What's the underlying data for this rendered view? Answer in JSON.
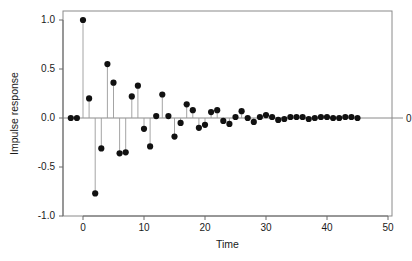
{
  "chart_data": {
    "type": "scatter",
    "title": "",
    "subtitle": "",
    "xlabel": "Time",
    "ylabel": "Impulse response",
    "xlim": [
      -4,
      51
    ],
    "ylim": [
      -1.12,
      1.12
    ],
    "grid": false,
    "legend": null,
    "style": "stem-plot with points and vertical stems to zero baseline",
    "xticks": [
      "0",
      "10",
      "20",
      "30",
      "40",
      "50"
    ],
    "xtick_values": [
      0,
      10,
      20,
      30,
      40,
      50
    ],
    "yticks": [
      "1.0",
      "0.5",
      "0.0",
      "-0.5",
      "-1.0"
    ],
    "ytick_values": [
      1.0,
      0.5,
      0.0,
      -0.5,
      -1.0
    ],
    "right_axis_label": "0",
    "right_axis_value": 0,
    "x": [
      -2,
      -1,
      0,
      1,
      2,
      3,
      4,
      5,
      6,
      7,
      8,
      9,
      10,
      11,
      12,
      13,
      14,
      15,
      16,
      17,
      18,
      19,
      20,
      21,
      22,
      23,
      24,
      25,
      26,
      27,
      28,
      29,
      30,
      31,
      32,
      33,
      34,
      35,
      36,
      37,
      38,
      39,
      40,
      41,
      42,
      43,
      44,
      45
    ],
    "values": [
      0.0,
      0.0,
      1.0,
      0.2,
      -0.77,
      -0.31,
      0.55,
      0.36,
      -0.36,
      -0.35,
      0.22,
      0.33,
      -0.11,
      -0.29,
      0.02,
      0.24,
      0.02,
      -0.19,
      -0.05,
      0.14,
      0.08,
      -0.1,
      -0.07,
      0.06,
      0.08,
      -0.03,
      -0.06,
      0.01,
      0.07,
      0.0,
      -0.04,
      0.01,
      0.03,
      0.01,
      -0.02,
      -0.01,
      0.01,
      0.01,
      0.01,
      -0.01,
      0.0,
      0.01,
      0.01,
      0.0,
      0.0,
      0.01,
      0.01,
      0.0
    ],
    "point_color": "#111111",
    "stem_color": "#9a9a9a",
    "axis_color": "#6b6b6b",
    "frame_color": "#8a8a8a",
    "background": "#ffffff"
  },
  "geometry": {
    "plot_left": 63,
    "plot_right": 392,
    "plot_top": 11,
    "plot_bottom": 216,
    "x_zero_px": 83,
    "px_per_time": 6.1,
    "y_zero_px": 118,
    "px_per_unit": 98,
    "point_radius": 3.1
  }
}
